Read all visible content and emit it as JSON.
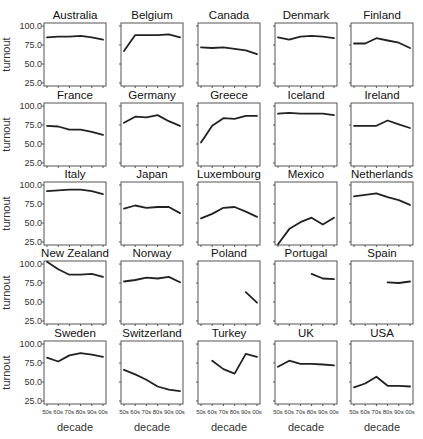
{
  "chart_data": {
    "type": "line",
    "title": "",
    "layout": "small-multiples 5x5 facet grid",
    "xlabel": "decade",
    "ylabel": "turnout",
    "x": [
      "50s",
      "60s",
      "70s",
      "80s",
      "90s",
      "00s"
    ],
    "yticks": [
      "25.0",
      "50.0",
      "75.0",
      "100.0"
    ],
    "ytick_values": [
      25,
      50,
      75,
      100
    ],
    "ylim": [
      21,
      104
    ],
    "grid": false,
    "legend": null,
    "series": [
      {
        "name": "Australia",
        "values": [
          85,
          86,
          86,
          87,
          85,
          82
        ]
      },
      {
        "name": "Belgium",
        "values": [
          67,
          88,
          88,
          88,
          89,
          85
        ]
      },
      {
        "name": "Canada",
        "values": [
          72,
          71,
          72,
          70,
          68,
          63
        ]
      },
      {
        "name": "Denmark",
        "values": [
          85,
          82,
          86,
          87,
          86,
          84
        ]
      },
      {
        "name": "Finland",
        "values": [
          77,
          77,
          84,
          81,
          78,
          71
        ]
      },
      {
        "name": "France",
        "values": [
          74,
          73,
          69,
          69,
          66,
          62
        ]
      },
      {
        "name": "Germany",
        "values": [
          78,
          86,
          85,
          88,
          80,
          74
        ]
      },
      {
        "name": "Greece",
        "values": [
          52,
          74,
          84,
          83,
          87,
          87
        ]
      },
      {
        "name": "Iceland",
        "values": [
          90,
          91,
          90,
          90,
          90,
          88
        ]
      },
      {
        "name": "Ireland",
        "values": [
          74,
          74,
          74,
          81,
          76,
          71
        ]
      },
      {
        "name": "Italy",
        "values": [
          92,
          93,
          94,
          94,
          92,
          88
        ]
      },
      {
        "name": "Japan",
        "values": [
          69,
          73,
          70,
          71,
          71,
          63
        ]
      },
      {
        "name": "Luxembourg",
        "values": [
          56,
          62,
          70,
          71,
          65,
          58
        ]
      },
      {
        "name": "Mexico",
        "values": [
          22,
          42,
          51,
          57,
          48,
          57
        ]
      },
      {
        "name": "Netherlands",
        "values": [
          85,
          87,
          89,
          84,
          80,
          74
        ]
      },
      {
        "name": "New Zealand",
        "values": [
          103,
          93,
          86,
          86,
          87,
          83
        ]
      },
      {
        "name": "Norway",
        "values": [
          77,
          79,
          82,
          81,
          83,
          76
        ]
      },
      {
        "name": "Poland",
        "values": [
          null,
          null,
          null,
          null,
          63,
          49
        ]
      },
      {
        "name": "Portugal",
        "values": [
          null,
          null,
          null,
          87,
          81,
          80
        ]
      },
      {
        "name": "Spain",
        "values": [
          null,
          null,
          null,
          76,
          75,
          77
        ]
      },
      {
        "name": "Sweden",
        "values": [
          82,
          77,
          85,
          88,
          86,
          83
        ]
      },
      {
        "name": "Switzerland",
        "values": [
          66,
          60,
          53,
          44,
          40,
          38
        ]
      },
      {
        "name": "Turkey",
        "values": [
          null,
          78,
          67,
          61,
          87,
          83
        ]
      },
      {
        "name": "UK",
        "values": [
          70,
          78,
          74,
          74,
          73,
          72
        ]
      },
      {
        "name": "USA",
        "values": [
          43,
          48,
          57,
          45,
          45,
          44
        ]
      }
    ]
  },
  "style": {
    "line_color": "#222222",
    "frame_color": "#555555",
    "background": "#ffffff"
  }
}
